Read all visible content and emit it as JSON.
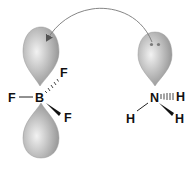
{
  "diagram": {
    "type": "lewis-acid-base-orbital-interaction",
    "arrow": {
      "from": "nitrogen-lone-pair-orbital",
      "to": "boron-empty-p-orbital",
      "color": "#777777"
    },
    "acceptor": {
      "central": "B",
      "substituents": [
        "F",
        "F",
        "F"
      ],
      "orbital": "empty p orbital (two lobes)"
    },
    "donor": {
      "central": "N",
      "substituents": [
        "H",
        "H",
        "H"
      ],
      "orbital": "lone pair sp3 orbital",
      "lone_pair_dots": 2
    },
    "labels": {
      "boron": "B",
      "f_left": "F",
      "f_upper_right": "F",
      "f_lower_right": "F",
      "nitrogen": "N",
      "h_right": "H",
      "h_lower_left": "H",
      "h_lower_right": "H"
    },
    "colors": {
      "lobe_light": "#e6e6e6",
      "lobe_dark": "#8a8a8a",
      "bond": "#222222",
      "text": "#111111",
      "dots": "#7a7a7a"
    }
  }
}
